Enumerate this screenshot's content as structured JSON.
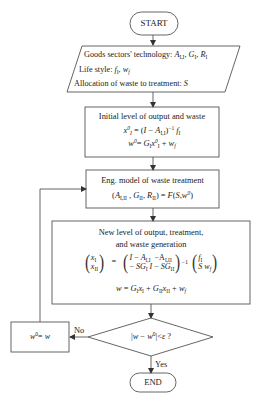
{
  "flowchart": {
    "start": {
      "label": "START"
    },
    "inputs": {
      "line1_prefix": "Goods sectors' technology: ",
      "line1_vars": "A_I,I, G_I, R_I",
      "line2_prefix": "Life style: ",
      "line2_vars": "f_I, w_f",
      "line3_prefix": "Allocation of waste to treatment: ",
      "line3_vars": "S"
    },
    "initial": {
      "title": "Initial level of output and waste",
      "eq1": "x_I^0 = (I − A_I,I)^−1 f_I",
      "eq2": "w^0 = G_I x^0_I + w_f"
    },
    "engineering": {
      "title": "Eng. model of waste treatment",
      "eq": "(A_I,II , G_II, R_II) = F(S, w^0)"
    },
    "new_level": {
      "title_line1": "New level of output, treatment,",
      "title_line2": "and waste generation",
      "matrix_eq": "(x_I; x_II) = (I − A_I,I  −A_I,II; −SG_I  I − SG_II)^−1 (f_I; S w_f)",
      "eq2": "w = G_I x_I + G_II x_II + w_f"
    },
    "decision": {
      "label": "|w − w^0| < ε ?",
      "yes_label": "Yes",
      "no_label": "No"
    },
    "update": {
      "label": "w^0 = w"
    },
    "end": {
      "label": "END"
    }
  },
  "colors": {
    "stroke": "#555555",
    "text": "#222222",
    "background": "#ffffff"
  }
}
